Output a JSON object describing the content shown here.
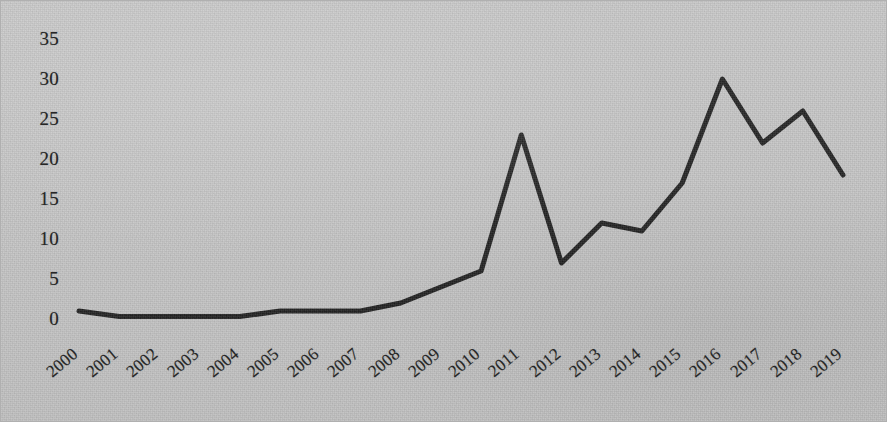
{
  "chart_data": {
    "type": "line",
    "title": "",
    "subtitle": "",
    "xlabel": "",
    "ylabel": "",
    "categories": [
      "2000",
      "2001",
      "2002",
      "2003",
      "2004",
      "2005",
      "2006",
      "2007",
      "2008",
      "2009",
      "2010",
      "2011",
      "2012",
      "2013",
      "2014",
      "2015",
      "2016",
      "2017",
      "2018",
      "2019"
    ],
    "values": [
      1,
      0.3,
      0.3,
      0.3,
      0.3,
      1,
      1,
      1,
      2,
      4,
      6,
      23,
      7,
      12,
      11,
      17,
      30,
      22,
      26,
      18
    ],
    "series": [
      {
        "name": "",
        "values": [
          1,
          0.3,
          0.3,
          0.3,
          0.3,
          1,
          1,
          1,
          2,
          4,
          6,
          23,
          7,
          12,
          11,
          17,
          30,
          22,
          26,
          18
        ]
      }
    ],
    "x": [
      "2000",
      "2001",
      "2002",
      "2003",
      "2004",
      "2005",
      "2006",
      "2007",
      "2008",
      "2009",
      "2010",
      "2011",
      "2012",
      "2013",
      "2014",
      "2015",
      "2016",
      "2017",
      "2018",
      "2019"
    ],
    "ylim": [
      0,
      35
    ],
    "xlim": [
      "2000",
      "2019"
    ],
    "yticks": [
      "0",
      "5",
      "10",
      "15",
      "20",
      "25",
      "30",
      "35"
    ],
    "ytick_values": [
      0,
      5,
      10,
      15,
      20,
      25,
      30,
      35
    ],
    "xticks": [
      "2000",
      "2001",
      "2002",
      "2003",
      "2004",
      "2005",
      "2006",
      "2007",
      "2008",
      "2009",
      "2010",
      "2011",
      "2012",
      "2013",
      "2014",
      "2015",
      "2016",
      "2017",
      "2018",
      "2019"
    ],
    "grid": false,
    "legend": null,
    "legend_position": "none",
    "annotations": [],
    "line_color": "#1a1a1a",
    "line_width": 5,
    "marker": "none",
    "background_color": "#c4c4c4",
    "text_color": "#262626",
    "xtick_rotation": -40
  }
}
